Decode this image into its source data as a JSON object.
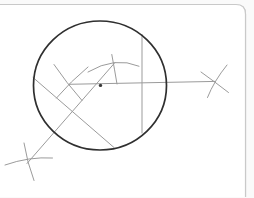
{
  "canvas": {
    "width": 254,
    "height": 197,
    "background": "#ffffff",
    "outside_background": "#fafafa"
  },
  "colors": {
    "card_border": "#c9c9c9",
    "construction_line": "#9b9b9b",
    "circle_stroke": "#2f2f2f",
    "dot_fill": "#3a3a3a"
  },
  "drawing": {
    "description": "compass-and-straightedge construction sketch: large circle with center dot, horizontal line extended to an external arc-cross on the right, vertical chord, two diagonal chords, and four compass arc cross marks",
    "shapes": [
      {
        "name": "page-card-border",
        "kind": "path",
        "d": "M 0 4.5 L 236 4.5 Q 245.5 4.5 245.5 14 L 245.5 197",
        "stroke": "card_border",
        "width": 1.2,
        "fill": "none"
      },
      {
        "name": "page-card-fill",
        "kind": "path",
        "d": "M 0 4.5 L 236 4.5 Q 245.5 4.5 245.5 14 L 245.5 197 L 0 197 Z",
        "stroke": "none",
        "width": 0,
        "fill": "#ffffff"
      },
      {
        "name": "card-border-line",
        "kind": "path",
        "d": "M 0 4.5 L 236 4.5 Q 245.5 4.5 245.5 14 L 245.5 197",
        "stroke": "card_border",
        "width": 1.2,
        "fill": "none"
      },
      {
        "name": "diagonal-chord-line",
        "kind": "path",
        "d": "M 33 77.5 L 114 147.5",
        "stroke": "construction_line",
        "width": 1,
        "fill": "none"
      },
      {
        "name": "diagonal-bisector-line",
        "kind": "path",
        "d": "M 27 163.5 L 115 62.5",
        "stroke": "construction_line",
        "width": 1,
        "fill": "none"
      },
      {
        "name": "horizontal-center-line",
        "kind": "path",
        "d": "M 69 84.3 L 215.3 81.4",
        "stroke": "construction_line",
        "width": 1,
        "fill": "none"
      },
      {
        "name": "vertical-chord-line",
        "kind": "path",
        "d": "M 142 34.5 L 142 133",
        "stroke": "construction_line",
        "width": 1,
        "fill": "none"
      },
      {
        "name": "left-cross-stroke-nw-se",
        "kind": "path",
        "d": "M 54 64.5 Q 66.5 83 82 100.5",
        "stroke": "construction_line",
        "width": 1,
        "fill": "none"
      },
      {
        "name": "left-cross-stroke-ne-sw",
        "kind": "path",
        "d": "M 88 67 Q 70.5 81.5 56.5 98",
        "stroke": "construction_line",
        "width": 1,
        "fill": "none"
      },
      {
        "name": "top-cross-arc",
        "kind": "path",
        "d": "M 88 72 Q 115 56 139 66.2",
        "stroke": "construction_line",
        "width": 1,
        "fill": "none"
      },
      {
        "name": "top-cross-tick",
        "kind": "path",
        "d": "M 111.8 54.5 Q 114.5 69 117 84",
        "stroke": "construction_line",
        "width": 1,
        "fill": "none"
      },
      {
        "name": "right-cross-stroke-steep",
        "kind": "path",
        "d": "M 227 65 Q 214 81 207.5 97.5",
        "stroke": "construction_line",
        "width": 1,
        "fill": "none"
      },
      {
        "name": "right-cross-stroke-shallow",
        "kind": "path",
        "d": "M 201 72 Q 215 82 228.5 92.5",
        "stroke": "construction_line",
        "width": 1,
        "fill": "none"
      },
      {
        "name": "bottom-left-cross-arc",
        "kind": "path",
        "d": "M 5 165 Q 29 156.5 52.5 158",
        "stroke": "construction_line",
        "width": 1,
        "fill": "none"
      },
      {
        "name": "bottom-left-cross-tick",
        "kind": "path",
        "d": "M 24 143 Q 27 162 34 180.5",
        "stroke": "construction_line",
        "width": 1,
        "fill": "none"
      },
      {
        "name": "main-circle",
        "kind": "ellipse",
        "cx": 100,
        "cy": 85.5,
        "rx": 66.5,
        "ry": 64.5,
        "stroke": "circle_stroke",
        "width": 1.7,
        "fill": "none"
      },
      {
        "name": "center-dot",
        "kind": "circle",
        "cx": 100.5,
        "cy": 85.4,
        "r": 1.7,
        "stroke": "none",
        "width": 0,
        "fill": "dot_fill"
      }
    ]
  }
}
